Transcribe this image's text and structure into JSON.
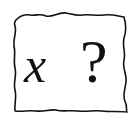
{
  "card": {
    "variable": "x",
    "question_mark": "?",
    "border_color": "#111111",
    "background": "#ffffff"
  }
}
